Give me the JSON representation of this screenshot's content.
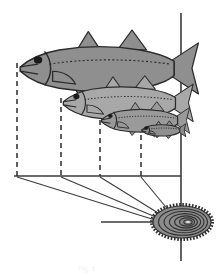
{
  "figure": {
    "caption": "Fig. 1",
    "background_color": "#ffffff",
    "line_color": "#3b3b3b",
    "axis": {
      "vertical_axis_label": "body-axis-reference-line",
      "horizontal_axis_label": "length-baseline",
      "vertical_x": 181,
      "vertical_y_top": 13,
      "vertical_y_bottom": 261,
      "baseline_y": 176,
      "baseline_x_start": 14,
      "baseline_x_end": 181,
      "otolith_axis_y": 222,
      "otolith_axis_x_start": 101,
      "otolith_axis_x_end": 205
    },
    "fish": [
      {
        "id": "fish-1",
        "age_class": "4",
        "snout_x": 17,
        "snout_y": 62,
        "length_px": 164,
        "body_fill": "#8f8f8f",
        "outline": "#2b2b2b",
        "scale": 1.0,
        "label": "largest-fish-oldest"
      },
      {
        "id": "fish-2",
        "age_class": "3",
        "snout_x": 61,
        "snout_y": 97,
        "length_px": 120,
        "body_fill": "#a8a8a8",
        "outline": "#2b2b2b",
        "scale": 0.73,
        "label": "second-fish"
      },
      {
        "id": "fish-3",
        "age_class": "2",
        "snout_x": 100,
        "snout_y": 119,
        "length_px": 81,
        "body_fill": "#9a9a9a",
        "outline": "#2b2b2b",
        "scale": 0.49,
        "label": "third-fish"
      },
      {
        "id": "fish-4",
        "age_class": "1",
        "snout_x": 141,
        "snout_y": 134,
        "length_px": 40,
        "body_fill": "#8f8f8f",
        "outline": "#2b2b2b",
        "scale": 0.245,
        "label": "smallest-fish-youngest"
      }
    ],
    "drop_lines": [
      {
        "id": "drop-line-1",
        "x": 17,
        "y_top": 63,
        "y_bottom": 176,
        "style": "dashed"
      },
      {
        "id": "drop-line-2",
        "x": 61,
        "y_top": 98,
        "y_bottom": 176,
        "style": "dashed"
      },
      {
        "id": "drop-line-3",
        "x": 100,
        "y_top": 120,
        "y_bottom": 176,
        "style": "dashed"
      },
      {
        "id": "drop-line-4",
        "x": 141,
        "y_top": 135,
        "y_bottom": 176,
        "style": "dashed"
      }
    ],
    "projection_lines": [
      {
        "id": "projection-line-1",
        "from_x": 17,
        "from_y": 176,
        "to_x": 183,
        "to_y": 228
      },
      {
        "id": "projection-line-2",
        "from_x": 61,
        "from_y": 176,
        "to_x": 183,
        "to_y": 228
      },
      {
        "id": "projection-line-3",
        "from_x": 100,
        "from_y": 176,
        "to_x": 183,
        "to_y": 228
      },
      {
        "id": "projection-line-4",
        "from_x": 141,
        "from_y": 176,
        "to_x": 183,
        "to_y": 228
      }
    ],
    "otolith": {
      "label": "otolith-with-growth-rings",
      "center_x": 182,
      "center_y": 222,
      "radius_x": 30,
      "radius_y": 17,
      "rings_count": 7,
      "body_fill": "#8c8c8c",
      "ring_color": "#2f2f2f",
      "edge_style": "crenulated",
      "nucleus_label": "otolith-nucleus"
    }
  }
}
